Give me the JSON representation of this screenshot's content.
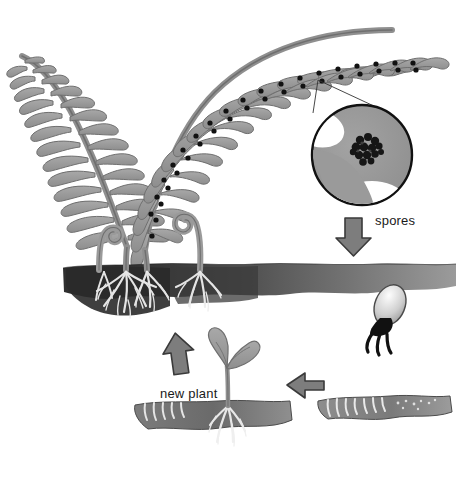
{
  "diagram": {
    "background_color": "#ffffff",
    "labels": {
      "spores": "spores",
      "new_plant": "new plant"
    },
    "colors": {
      "frond_fill": "#9a9a9a",
      "frond_stroke": "#6e6e6e",
      "sorus_dot": "#111111",
      "soil_dark": "#3a3a3a",
      "soil_light": "#8a8a8a",
      "root_white": "#f2f2f2",
      "arrow_fill": "#7d7d7d",
      "arrow_stroke": "#3a3a3a",
      "outline": "#111111"
    },
    "parts": [
      {
        "name": "mature-fern-fronds",
        "description": "two arching fern fronds with pinnae bearing sori"
      },
      {
        "name": "sori-dots",
        "description": "black dots along the right frond pinnae"
      },
      {
        "name": "magnifier-circle",
        "description": "close-up of a pinna showing a spore cluster (sorus)"
      },
      {
        "name": "spores-arrow",
        "description": "downward arrow labelled spores"
      },
      {
        "name": "germinating-spore",
        "description": "spore with rhizoids below soil on the right"
      },
      {
        "name": "prothallus-soil-patch",
        "description": "soil patch with white rhizoids, bottom right"
      },
      {
        "name": "right-arrow",
        "description": "arrow pointing left toward the new plant"
      },
      {
        "name": "new-plant",
        "description": "young fern seedling with two leaflets and roots"
      },
      {
        "name": "up-arrow",
        "description": "arrow pointing up back to the mature fern"
      },
      {
        "name": "soil-band",
        "description": "horizontal soil strip with fern roots"
      },
      {
        "name": "fiddleheads",
        "description": "curled young fronds emerging from the soil"
      }
    ],
    "stages": [
      {
        "order": 1,
        "name": "mature sporophyte"
      },
      {
        "order": 2,
        "name": "spores released"
      },
      {
        "order": 3,
        "name": "spore germinates"
      },
      {
        "order": 4,
        "name": "gametophyte / prothallus"
      },
      {
        "order": 5,
        "name": "new plant"
      }
    ]
  }
}
